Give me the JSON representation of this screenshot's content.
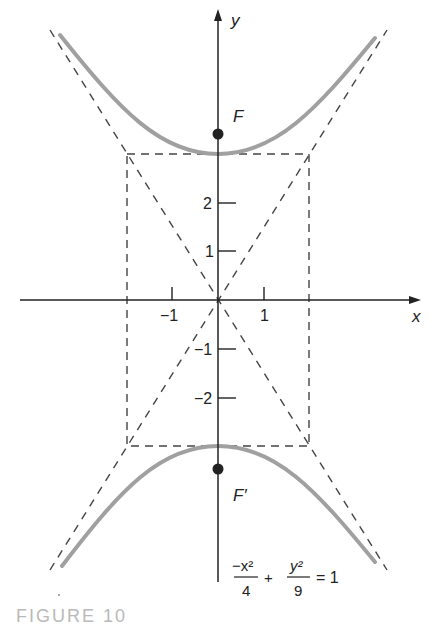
{
  "figure": {
    "caption": "FIGURE 10",
    "equation": {
      "term1_numerator": "−x²",
      "term1_denominator": "4",
      "plus": "+",
      "term2_numerator": "y²",
      "term2_denominator": "9",
      "rhs": "= 1"
    },
    "axes": {
      "x_label": "x",
      "y_label": "y",
      "x_ticks": [
        {
          "value": -1,
          "label": "−1"
        },
        {
          "value": 1,
          "label": "1"
        }
      ],
      "y_ticks": [
        {
          "value": 2,
          "label": "2"
        },
        {
          "value": 1,
          "label": "1"
        },
        {
          "value": -1,
          "label": "−1"
        },
        {
          "value": -2,
          "label": "−2"
        }
      ]
    },
    "foci": {
      "upper": {
        "label": "F",
        "x": 0,
        "y": 3.606
      },
      "lower": {
        "label": "F′",
        "x": 0,
        "y": -3.606
      }
    },
    "curve": {
      "type": "hyperbola",
      "a_y": 3,
      "b_x": 2,
      "asymptotes": [
        "y = 3x/2",
        "y = -3x/2"
      ],
      "color": "#a0a0a0"
    },
    "central_rectangle": {
      "x": [
        -2,
        2
      ],
      "y": [
        -3,
        3
      ]
    },
    "colors": {
      "axis": "#222222",
      "dashed": "#444444",
      "curve": "#a0a0a0",
      "caption": "#b9b9b9"
    }
  }
}
